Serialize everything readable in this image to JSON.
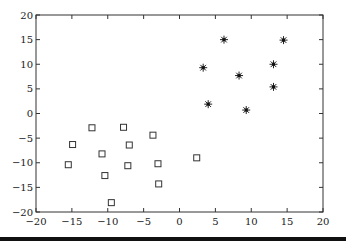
{
  "chart_data": {
    "type": "scatter",
    "title": "",
    "xlabel": "",
    "ylabel": "",
    "xlim": [
      -20,
      20
    ],
    "ylim": [
      -20,
      20
    ],
    "grid": false,
    "legend": null,
    "xticks": [
      -20,
      -15,
      -10,
      -5,
      0,
      5,
      10,
      15,
      20
    ],
    "yticks": [
      -20,
      -15,
      -10,
      -5,
      0,
      5,
      10,
      15,
      20
    ],
    "xtick_labels": [
      "−20",
      "−15",
      "−10",
      "−5",
      "0",
      "5",
      "10",
      "15",
      "20"
    ],
    "ytick_labels": [
      "−20",
      "−15",
      "−10",
      "−5",
      "0",
      "5",
      "10",
      "15",
      "20"
    ],
    "series": [
      {
        "name": "class-square",
        "marker": "square",
        "color": "#333333",
        "points": [
          [
            -12.2,
            -2.9
          ],
          [
            -14.9,
            -6.3
          ],
          [
            -15.5,
            -10.4
          ],
          [
            -7.8,
            -2.8
          ],
          [
            -3.7,
            -4.4
          ],
          [
            -7.0,
            -6.4
          ],
          [
            -10.8,
            -8.2
          ],
          [
            -7.2,
            -10.6
          ],
          [
            -3.0,
            -10.2
          ],
          [
            -10.4,
            -12.6
          ],
          [
            -2.9,
            -14.3
          ],
          [
            -9.5,
            -18.1
          ],
          [
            2.4,
            -9.0
          ]
        ]
      },
      {
        "name": "class-star",
        "marker": "asterisk",
        "color": "#222222",
        "points": [
          [
            6.2,
            15.0
          ],
          [
            3.3,
            9.3
          ],
          [
            8.3,
            7.7
          ],
          [
            4.0,
            1.9
          ],
          [
            9.3,
            0.7
          ],
          [
            14.5,
            14.9
          ],
          [
            13.1,
            10.0
          ],
          [
            13.1,
            5.4
          ]
        ]
      }
    ]
  }
}
